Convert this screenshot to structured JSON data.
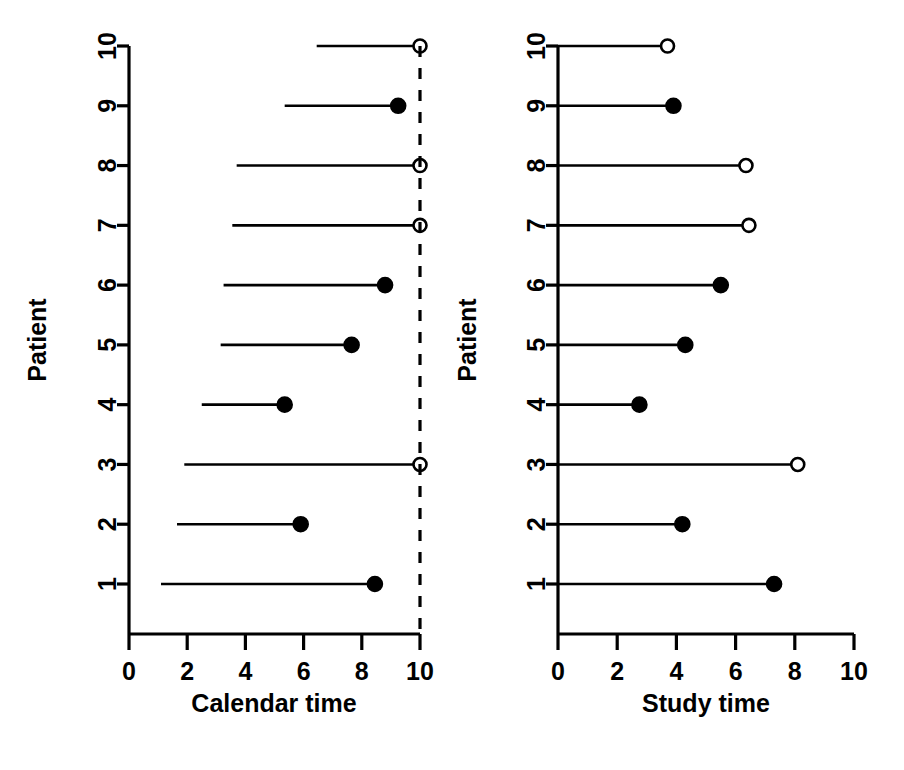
{
  "figure": {
    "title": "",
    "panel_count": 2
  },
  "chart_data": [
    {
      "type": "scatter",
      "title": "",
      "panel_name": "calendar-time-panel",
      "xlabel": "Calendar time",
      "ylabel": "Patient",
      "xlim": [
        0,
        10
      ],
      "ylim": [
        0,
        10.6
      ],
      "xticks": [
        0,
        2,
        4,
        6,
        8,
        10
      ],
      "xticklabels": [
        "0",
        "2",
        "4",
        "6",
        "8",
        "10"
      ],
      "yticks": [
        1,
        2,
        3,
        4,
        5,
        6,
        7,
        8,
        9,
        10
      ],
      "yticklabels": [
        "1",
        "2",
        "3",
        "4",
        "5",
        "6",
        "7",
        "8",
        "9",
        "10"
      ],
      "grid": false,
      "legend": "none",
      "annotations": [
        {
          "name": "study-end-cutoff",
          "kind": "vertical-dashed-line",
          "x": 10,
          "label": ""
        }
      ],
      "series": [
        {
          "name": "follow-up-segments",
          "style": "horizontal-line",
          "points": [
            {
              "patient": 1,
              "start": 1.1,
              "end": 8.45,
              "status": "event"
            },
            {
              "patient": 2,
              "start": 1.65,
              "end": 5.9,
              "status": "event"
            },
            {
              "patient": 3,
              "start": 1.9,
              "end": 10.0,
              "status": "censored"
            },
            {
              "patient": 4,
              "start": 2.5,
              "end": 5.35,
              "status": "event"
            },
            {
              "patient": 5,
              "start": 3.15,
              "end": 7.65,
              "status": "event"
            },
            {
              "patient": 6,
              "start": 3.25,
              "end": 8.8,
              "status": "event"
            },
            {
              "patient": 7,
              "start": 3.55,
              "end": 10.0,
              "status": "censored"
            },
            {
              "patient": 8,
              "start": 3.7,
              "end": 10.0,
              "status": "censored"
            },
            {
              "patient": 9,
              "start": 5.35,
              "end": 9.25,
              "status": "event"
            },
            {
              "patient": 10,
              "start": 6.45,
              "end": 10.0,
              "status": "censored"
            }
          ]
        }
      ]
    },
    {
      "type": "scatter",
      "title": "",
      "panel_name": "study-time-panel",
      "xlabel": "Study time",
      "ylabel": "Patient",
      "xlim": [
        0,
        10
      ],
      "ylim": [
        0,
        10.6
      ],
      "xticks": [
        0,
        2,
        4,
        6,
        8,
        10
      ],
      "xticklabels": [
        "0",
        "2",
        "4",
        "6",
        "8",
        "10"
      ],
      "yticks": [
        1,
        2,
        3,
        4,
        5,
        6,
        7,
        8,
        9,
        10
      ],
      "yticklabels": [
        "1",
        "2",
        "3",
        "4",
        "5",
        "6",
        "7",
        "8",
        "9",
        "10"
      ],
      "grid": false,
      "legend": "none",
      "annotations": [],
      "series": [
        {
          "name": "follow-up-segments",
          "style": "horizontal-line",
          "points": [
            {
              "patient": 1,
              "start": 0,
              "end": 7.3,
              "status": "event"
            },
            {
              "patient": 2,
              "start": 0,
              "end": 4.2,
              "status": "event"
            },
            {
              "patient": 3,
              "start": 0,
              "end": 8.1,
              "status": "censored"
            },
            {
              "patient": 4,
              "start": 0,
              "end": 2.75,
              "status": "event"
            },
            {
              "patient": 5,
              "start": 0,
              "end": 4.3,
              "status": "event"
            },
            {
              "patient": 6,
              "start": 0,
              "end": 5.5,
              "status": "event"
            },
            {
              "patient": 7,
              "start": 0,
              "end": 6.45,
              "status": "censored"
            },
            {
              "patient": 8,
              "start": 0,
              "end": 6.35,
              "status": "censored"
            },
            {
              "patient": 9,
              "start": 0,
              "end": 3.9,
              "status": "event"
            },
            {
              "patient": 10,
              "start": 0,
              "end": 3.7,
              "status": "censored"
            }
          ]
        }
      ]
    }
  ],
  "style": {
    "ink_color": "#000000",
    "background_color": "#ffffff",
    "event_marker": "filled-circle",
    "censored_marker": "open-circle"
  }
}
